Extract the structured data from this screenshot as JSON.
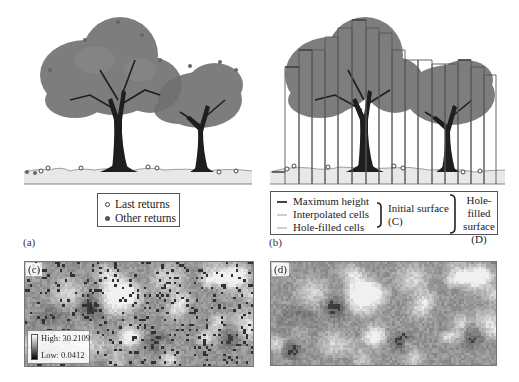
{
  "figure": {
    "panels": {
      "a": {
        "label": "(a)",
        "legend": {
          "items": [
            {
              "marker": "open-circle",
              "label": "Last returns"
            },
            {
              "marker": "filled-circle",
              "label": "Other returns"
            }
          ]
        }
      },
      "b": {
        "label": "(b)",
        "legend": {
          "items": [
            {
              "swatch": "dark-line",
              "label": "Maximum height",
              "color": "#444444"
            },
            {
              "swatch": "light-line",
              "label": "Interpolated cells",
              "color": "#cfcfcf"
            },
            {
              "swatch": "light-line",
              "label": "Hole-filled cells",
              "color": "#cfcfcf"
            }
          ],
          "group_initial": {
            "line1": "Initial surface",
            "line2": "(C)"
          },
          "group_holefilled": {
            "line1": "Hole-filled",
            "line2": "surface",
            "line3": "(D)"
          }
        }
      },
      "c": {
        "label": "(c)",
        "scale": {
          "high_label": "High: 30.2109",
          "low_label": "Low: 0.0412"
        }
      },
      "d": {
        "label": "(d)"
      }
    },
    "colors": {
      "canopy": "#6e6e6e",
      "trunk": "#1e1e1e",
      "ground": "#e6e6e6",
      "outline": "#555555"
    }
  }
}
